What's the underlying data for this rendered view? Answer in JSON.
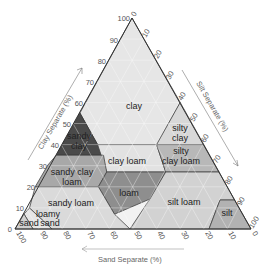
{
  "axes": {
    "clay": {
      "label": "Clay Separate (%)",
      "ticks": [
        "0",
        "10",
        "20",
        "30",
        "40",
        "50",
        "60",
        "70",
        "80",
        "90",
        "100"
      ]
    },
    "silt": {
      "label": "Silt Separate (%)",
      "ticks": [
        "0",
        "10",
        "20",
        "30",
        "40",
        "50",
        "60",
        "70",
        "80",
        "90",
        "100"
      ]
    },
    "sand": {
      "label": "Sand Separate (%)",
      "ticks": [
        "100",
        "90",
        "80",
        "70",
        "60",
        "50",
        "40",
        "30",
        "20",
        "10",
        "0"
      ]
    }
  },
  "classes": [
    {
      "name": "clay",
      "label": [
        "clay"
      ],
      "color": "#e4e4e4"
    },
    {
      "name": "sandy-clay",
      "label": [
        "sandy",
        "clay"
      ],
      "color": "#4a4a4a"
    },
    {
      "name": "silty-clay",
      "label": [
        "silty",
        "clay"
      ],
      "color": "#d6d6d6"
    },
    {
      "name": "sandy-clay-loam",
      "label": [
        "sandy clay",
        "loam"
      ],
      "color": "#a8a8a8"
    },
    {
      "name": "clay-loam",
      "label": [
        "clay loam"
      ],
      "color": "#e2e2e2"
    },
    {
      "name": "silty-clay-loam",
      "label": [
        "silty",
        "clay loam"
      ],
      "color": "#b8b8b8"
    },
    {
      "name": "sandy-loam",
      "label": [
        "sandy loam"
      ],
      "color": "#dadada"
    },
    {
      "name": "loam",
      "label": [
        "loam"
      ],
      "color": "#8e8e8e"
    },
    {
      "name": "silt-loam",
      "label": [
        "silt loam"
      ],
      "color": "#cfcfcf"
    },
    {
      "name": "loamy-sand",
      "label": [
        "loamy",
        "sand"
      ],
      "color": "#e6e6e6"
    },
    {
      "name": "sand",
      "label": [
        "sand"
      ],
      "color": "#d0d0d0"
    },
    {
      "name": "silt",
      "label": [
        "silt"
      ],
      "color": "#b2b2b2"
    }
  ]
}
